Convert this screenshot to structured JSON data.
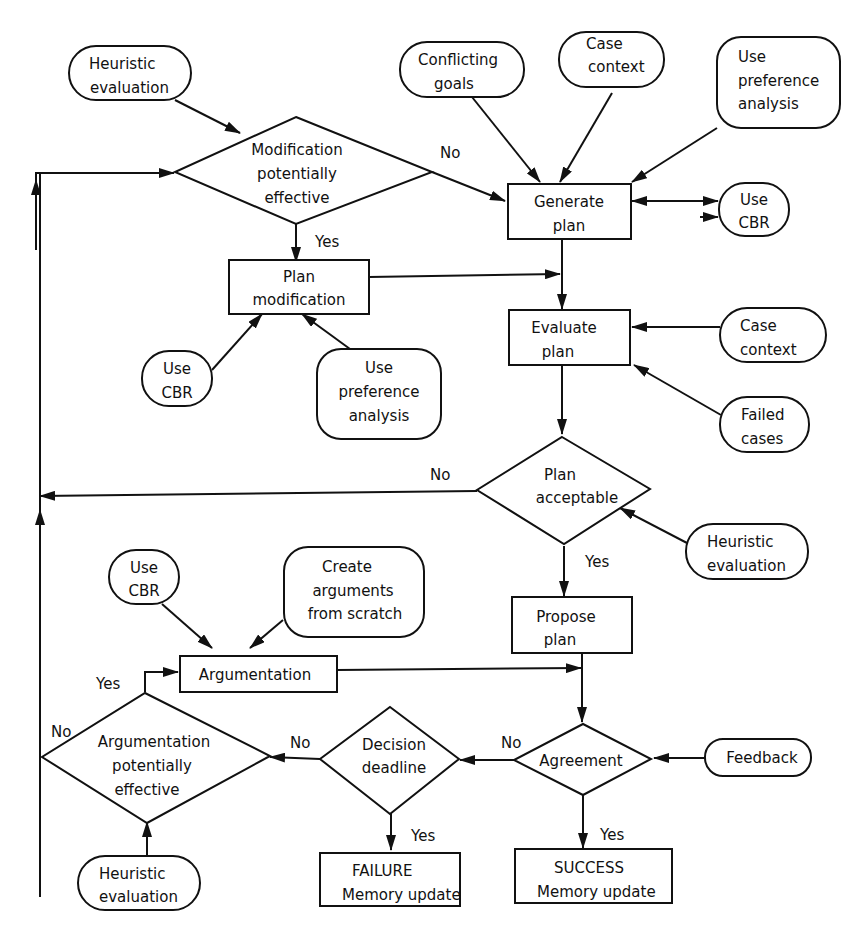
{
  "diagram": {
    "type": "flowchart",
    "nodes": {
      "heuristic_eval_top": {
        "shape": "terminal",
        "lines": [
          "Heuristic",
          "evaluation"
        ]
      },
      "modification_decision": {
        "shape": "decision",
        "lines": [
          "Modification",
          "potentially",
          "effective"
        ]
      },
      "conflicting_goals": {
        "shape": "terminal",
        "lines": [
          "Conflicting",
          "goals"
        ]
      },
      "case_context_top": {
        "shape": "terminal",
        "lines": [
          "Case",
          "context"
        ]
      },
      "use_pref_top": {
        "shape": "terminal",
        "lines": [
          "Use",
          "preference",
          "analysis"
        ]
      },
      "generate_plan": {
        "shape": "process",
        "lines": [
          "Generate",
          "plan"
        ]
      },
      "use_cbr_right": {
        "shape": "terminal",
        "lines": [
          "Use",
          "CBR"
        ]
      },
      "plan_modification": {
        "shape": "process",
        "lines": [
          "Plan",
          "modification"
        ]
      },
      "use_cbr_mod": {
        "shape": "terminal",
        "lines": [
          "Use",
          "CBR"
        ]
      },
      "use_pref_mod": {
        "shape": "terminal",
        "lines": [
          "Use",
          "preference",
          "analysis"
        ]
      },
      "evaluate_plan": {
        "shape": "process",
        "lines": [
          "Evaluate",
          "plan"
        ]
      },
      "case_context_right": {
        "shape": "terminal",
        "lines": [
          "Case",
          "context"
        ]
      },
      "failed_cases": {
        "shape": "terminal",
        "lines": [
          "Failed",
          "cases"
        ]
      },
      "plan_acceptable": {
        "shape": "decision",
        "lines": [
          "Plan",
          "acceptable"
        ]
      },
      "heuristic_eval_right": {
        "shape": "terminal",
        "lines": [
          "Heuristic",
          "evaluation"
        ]
      },
      "use_cbr_arg": {
        "shape": "terminal",
        "lines": [
          "Use",
          "CBR"
        ]
      },
      "create_args": {
        "shape": "terminal",
        "lines": [
          "Create",
          "arguments",
          "from scratch"
        ]
      },
      "argumentation": {
        "shape": "process",
        "lines": [
          "Argumentation"
        ]
      },
      "propose_plan": {
        "shape": "process",
        "lines": [
          "Propose",
          "plan"
        ]
      },
      "argumentation_decision": {
        "shape": "decision",
        "lines": [
          "Argumentation",
          "potentially",
          "effective"
        ]
      },
      "decision_deadline": {
        "shape": "decision",
        "lines": [
          "Decision",
          "deadline"
        ]
      },
      "agreement": {
        "shape": "decision",
        "lines": [
          "Agreement"
        ]
      },
      "feedback": {
        "shape": "terminal",
        "lines": [
          "Feedback"
        ]
      },
      "heuristic_eval_bottom": {
        "shape": "terminal",
        "lines": [
          "Heuristic",
          "evaluation"
        ]
      },
      "failure": {
        "shape": "process",
        "lines": [
          "FAILURE",
          "Memory update"
        ]
      },
      "success": {
        "shape": "process",
        "lines": [
          "SUCCESS",
          "Memory update"
        ]
      }
    },
    "edge_labels": {
      "mod_no": "No",
      "mod_yes": "Yes",
      "acc_no": "No",
      "acc_yes": "Yes",
      "arg_yes": "Yes",
      "arg_no": "No",
      "dead_no": "No",
      "dead_yes": "Yes",
      "agr_no": "No",
      "agr_yes": "Yes"
    },
    "edges": [
      {
        "from": "heuristic_eval_top",
        "to": "modification_decision"
      },
      {
        "from": "modification_decision",
        "to": "generate_plan",
        "label": "No"
      },
      {
        "from": "modification_decision",
        "to": "plan_modification",
        "label": "Yes"
      },
      {
        "from": "conflicting_goals",
        "to": "generate_plan"
      },
      {
        "from": "case_context_top",
        "to": "generate_plan"
      },
      {
        "from": "use_pref_top",
        "to": "generate_plan"
      },
      {
        "from": "generate_plan",
        "to": "use_cbr_right",
        "bidirectional": true
      },
      {
        "from": "use_cbr_mod",
        "to": "plan_modification"
      },
      {
        "from": "use_pref_mod",
        "to": "plan_modification"
      },
      {
        "from": "plan_modification",
        "to": "evaluate_plan"
      },
      {
        "from": "generate_plan",
        "to": "evaluate_plan"
      },
      {
        "from": "case_context_right",
        "to": "evaluate_plan"
      },
      {
        "from": "failed_cases",
        "to": "evaluate_plan"
      },
      {
        "from": "evaluate_plan",
        "to": "plan_acceptable"
      },
      {
        "from": "heuristic_eval_right",
        "to": "plan_acceptable"
      },
      {
        "from": "plan_acceptable",
        "to": "modification_decision",
        "label": "No"
      },
      {
        "from": "plan_acceptable",
        "to": "propose_plan",
        "label": "Yes"
      },
      {
        "from": "use_cbr_arg",
        "to": "argumentation"
      },
      {
        "from": "create_args",
        "to": "argumentation"
      },
      {
        "from": "argumentation",
        "to": "agreement"
      },
      {
        "from": "propose_plan",
        "to": "agreement"
      },
      {
        "from": "feedback",
        "to": "agreement"
      },
      {
        "from": "agreement",
        "to": "decision_deadline",
        "label": "No"
      },
      {
        "from": "agreement",
        "to": "success",
        "label": "Yes"
      },
      {
        "from": "decision_deadline",
        "to": "argumentation_decision",
        "label": "No"
      },
      {
        "from": "decision_deadline",
        "to": "failure",
        "label": "Yes"
      },
      {
        "from": "argumentation_decision",
        "to": "argumentation",
        "label": "Yes"
      },
      {
        "from": "argumentation_decision",
        "to": "modification_decision",
        "label": "No"
      },
      {
        "from": "heuristic_eval_bottom",
        "to": "argumentation_decision"
      }
    ]
  }
}
